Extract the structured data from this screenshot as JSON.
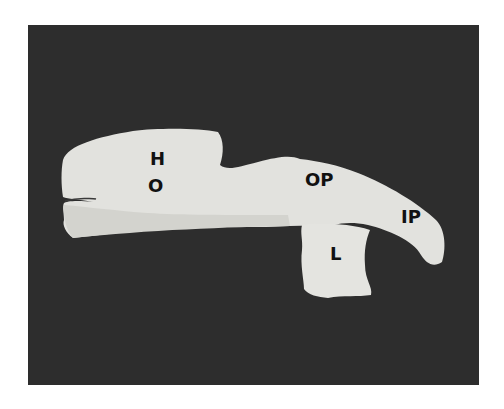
{
  "figure": {
    "colors": {
      "background": "#2d2d2d",
      "object": "#e2e2de",
      "object_shadow": "#c9c9c4",
      "label": "#111111"
    },
    "labels": {
      "h": "H",
      "o": "O",
      "op": "OP",
      "ip": "IP",
      "l": "L"
    }
  }
}
